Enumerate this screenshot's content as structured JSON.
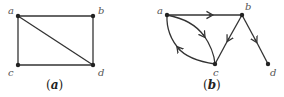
{
  "graphs": [
    {
      "id": "a",
      "caption": "(a)",
      "caption_inner": "a",
      "directed": false,
      "nodes": [
        {
          "label": "a",
          "x": 18,
          "y": 16
        },
        {
          "label": "b",
          "x": 93,
          "y": 16
        },
        {
          "label": "c",
          "x": 18,
          "y": 65
        },
        {
          "label": "d",
          "x": 93,
          "y": 65
        }
      ],
      "edges": [
        [
          "a",
          "b"
        ],
        [
          "a",
          "c"
        ],
        [
          "c",
          "d"
        ],
        [
          "b",
          "d"
        ],
        [
          "a",
          "d"
        ]
      ]
    },
    {
      "id": "b",
      "caption": "(b)",
      "caption_inner": "b",
      "directed": true,
      "nodes": [
        {
          "label": "a",
          "x": 167,
          "y": 15
        },
        {
          "label": "b",
          "x": 242,
          "y": 15
        },
        {
          "label": "c",
          "x": 215,
          "y": 64
        },
        {
          "label": "d",
          "x": 268,
          "y": 64
        }
      ],
      "edges": [
        [
          "a",
          "b"
        ],
        [
          "a",
          "c"
        ],
        [
          "c",
          "a"
        ],
        [
          "b",
          "c"
        ],
        [
          "b",
          "d"
        ]
      ]
    }
  ],
  "colors": {
    "edge": "#333333",
    "node": "#222222",
    "label": "#555555"
  }
}
